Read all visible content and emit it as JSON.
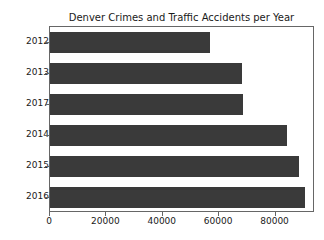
{
  "chart_data": {
    "type": "bar",
    "orientation": "horizontal",
    "title": "Denver Crimes and Traffic Accidents per Year",
    "xlabel": "",
    "ylabel": "",
    "categories": [
      "2012",
      "2013",
      "2017",
      "2014",
      "2015",
      "2016"
    ],
    "values": [
      56700,
      68100,
      68300,
      84000,
      88500,
      90500
    ],
    "xlim": [
      0,
      94000
    ],
    "xticks": [
      0,
      20000,
      40000,
      60000,
      80000
    ],
    "xtick_labels": [
      "0",
      "20000",
      "40000",
      "60000",
      "80000"
    ],
    "ytick_labels": [
      "2012",
      "2013",
      "2017",
      "2014",
      "2015",
      "2016"
    ],
    "grid": false,
    "legend": false,
    "bar_color": "#3a3a3a",
    "axes_color": "#666666",
    "text_color": "#1a1a1a",
    "background_color": "#ffffff"
  }
}
